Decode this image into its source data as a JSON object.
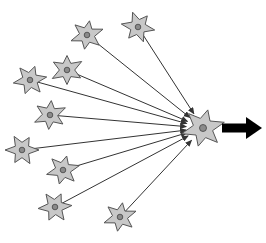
{
  "diagram": {
    "colors": {
      "neuron_fill": "#c8c8c8",
      "neuron_stroke": "#555555",
      "nucleus_fill": "#8a8a8a",
      "line": "#333333",
      "output_arrow": "#000000",
      "background": "#ffffff"
    },
    "target_neuron": {
      "x": 203,
      "y": 128,
      "r": 22
    },
    "input_neurons": [
      {
        "x": 87,
        "y": 35,
        "r": 17,
        "rot": 10
      },
      {
        "x": 138,
        "y": 27,
        "r": 17,
        "rot": 40
      },
      {
        "x": 67,
        "y": 70,
        "r": 17,
        "rot": 0
      },
      {
        "x": 30,
        "y": 80,
        "r": 17,
        "rot": 20
      },
      {
        "x": 50,
        "y": 115,
        "r": 17,
        "rot": 5
      },
      {
        "x": 22,
        "y": 150,
        "r": 17,
        "rot": 30
      },
      {
        "x": 63,
        "y": 170,
        "r": 17,
        "rot": 15
      },
      {
        "x": 55,
        "y": 207,
        "r": 17,
        "rot": 25
      },
      {
        "x": 120,
        "y": 217,
        "r": 17,
        "rot": 10
      }
    ],
    "output_arrow": {
      "x1": 222,
      "y1": 128,
      "x2": 262,
      "y2": 128
    }
  }
}
